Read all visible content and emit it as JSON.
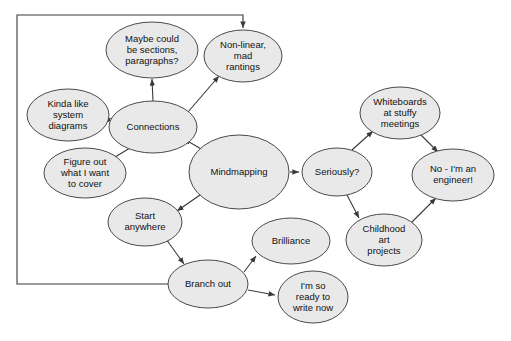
{
  "diagram": {
    "type": "mind-map",
    "background_color": "#ffffff",
    "node_fill_color": "#e9e9e9",
    "node_stroke_color": "#4a4a4a",
    "edge_color": "#3a3a3a",
    "nodes": [
      {
        "id": "maybe-sections",
        "lines": [
          "Maybe could",
          "be sections,",
          "paragraphs?"
        ],
        "cx": 152,
        "cy": 50,
        "rx": 46,
        "ry": 28
      },
      {
        "id": "non-linear",
        "lines": [
          "Non-linear,",
          "mad",
          "rantings"
        ],
        "cx": 243,
        "cy": 56,
        "rx": 39,
        "ry": 26
      },
      {
        "id": "kinda-like-system-diagrams",
        "lines": [
          "Kinda like",
          "system",
          "diagrams"
        ],
        "cx": 68,
        "cy": 115,
        "rx": 41,
        "ry": 26
      },
      {
        "id": "connections",
        "lines": [
          "Connections"
        ],
        "cx": 153,
        "cy": 127,
        "rx": 44,
        "ry": 26
      },
      {
        "id": "figure-out",
        "lines": [
          "Figure out",
          "what I want",
          "to cover"
        ],
        "cx": 85,
        "cy": 173,
        "rx": 41,
        "ry": 25
      },
      {
        "id": "mindmapping",
        "lines": [
          "Mindmapping"
        ],
        "cx": 239,
        "cy": 172,
        "rx": 50,
        "ry": 37
      },
      {
        "id": "start-anywhere",
        "lines": [
          "Start",
          "anywhere"
        ],
        "cx": 145,
        "cy": 222,
        "rx": 37,
        "ry": 24
      },
      {
        "id": "branch-out",
        "lines": [
          "Branch out"
        ],
        "cx": 208,
        "cy": 284,
        "rx": 40,
        "ry": 24
      },
      {
        "id": "brilliance",
        "lines": [
          "Brilliance"
        ],
        "cx": 291,
        "cy": 241,
        "rx": 39,
        "ry": 23
      },
      {
        "id": "ready-to-write",
        "lines": [
          "I'm so",
          "ready to",
          "write now"
        ],
        "cx": 313,
        "cy": 297,
        "rx": 35,
        "ry": 26
      },
      {
        "id": "seriously",
        "lines": [
          "Seriously?"
        ],
        "cx": 337,
        "cy": 172,
        "rx": 35,
        "ry": 24
      },
      {
        "id": "whiteboards",
        "lines": [
          "Whiteboards",
          "at stuffy",
          "meetings"
        ],
        "cx": 400,
        "cy": 113,
        "rx": 40,
        "ry": 26
      },
      {
        "id": "no-im-an-engineer",
        "lines": [
          "No - I'm an",
          "engineer!"
        ],
        "cx": 453,
        "cy": 175,
        "rx": 41,
        "ry": 26
      },
      {
        "id": "childhood-art",
        "lines": [
          "Childhood",
          "art",
          "projects"
        ],
        "cx": 384,
        "cy": 240,
        "rx": 38,
        "ry": 26
      }
    ],
    "edges": [
      {
        "id": "connections-to-maybe",
        "from": "connections",
        "to": "maybe-sections",
        "path": "M 153,101 L 152,79"
      },
      {
        "id": "connections-to-non-linear",
        "from": "connections",
        "to": "non-linear",
        "path": "M 188,112 L 219,76"
      },
      {
        "id": "connections-to-kinda-like",
        "from": "connections",
        "to": "kinda-like-system-diagrams",
        "path": "M 112,122 L 104,117"
      },
      {
        "id": "connections-to-figure-out",
        "from": "connections",
        "to": "figure-out",
        "path": "M 130,148 L 110,160"
      },
      {
        "id": "mindmapping-to-connections",
        "from": "mindmapping",
        "to": "connections",
        "path": "M 203,150 L 184,139"
      },
      {
        "id": "mindmapping-to-start-anywhere",
        "from": "mindmapping",
        "to": "start-anywhere",
        "path": "M 200,195 L 177,211"
      },
      {
        "id": "mindmapping-to-seriously",
        "from": "mindmapping",
        "to": "seriously",
        "path": "M 290,172 L 299,172"
      },
      {
        "id": "start-anywhere-to-branch-out",
        "from": "start-anywhere",
        "to": "branch-out",
        "path": "M 166,239 L 184,264"
      },
      {
        "id": "branch-out-to-brilliance",
        "from": "branch-out",
        "to": "brilliance",
        "path": "M 244,272 L 256,256"
      },
      {
        "id": "branch-out-to-ready",
        "from": "branch-out",
        "to": "ready-to-write",
        "path": "M 248,290 L 275,295"
      },
      {
        "id": "seriously-to-whiteboards",
        "from": "seriously",
        "to": "whiteboards",
        "path": "M 352,150 L 373,131"
      },
      {
        "id": "seriously-to-childhood",
        "from": "seriously",
        "to": "childhood-art",
        "path": "M 347,195 L 359,218"
      },
      {
        "id": "whiteboards-to-engineer",
        "from": "whiteboards",
        "to": "no-im-an-engineer",
        "path": "M 420,134 L 438,152"
      },
      {
        "id": "childhood-to-engineer",
        "from": "childhood-art",
        "to": "no-im-an-engineer",
        "path": "M 410,224 L 436,198"
      },
      {
        "id": "branch-out-loop-to-non-linear",
        "from": "branch-out",
        "to": "non-linear",
        "path": "M 168,284 L 17,284 L 17,15 L 243,15 L 243,28"
      }
    ],
    "arrow_marker": {
      "id": "arrowhead",
      "color": "#3a3a3a"
    }
  }
}
